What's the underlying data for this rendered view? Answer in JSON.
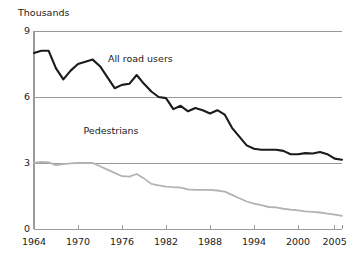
{
  "chart_data": {
    "type": "line",
    "title": "",
    "subtitle": "",
    "unit_label": "Thousands",
    "xlabel": "",
    "ylabel": "",
    "xlim": [
      1964,
      2006
    ],
    "ylim": [
      0,
      9
    ],
    "yticks": [
      0,
      3,
      6,
      9
    ],
    "ytick_labels": [
      "0",
      "3",
      "6",
      "9"
    ],
    "xticks": [
      1964,
      1970,
      1976,
      1982,
      1988,
      1994,
      2000,
      2005
    ],
    "xtick_labels": [
      "1964",
      "1970",
      "1976",
      "1982",
      "1988",
      "1994",
      "2000",
      "2005"
    ],
    "grid": "horizontal",
    "legend_position": "inline-annotations",
    "x": [
      1964,
      1965,
      1966,
      1967,
      1968,
      1969,
      1970,
      1971,
      1972,
      1973,
      1974,
      1975,
      1976,
      1977,
      1978,
      1979,
      1980,
      1981,
      1982,
      1983,
      1984,
      1985,
      1986,
      1987,
      1988,
      1989,
      1990,
      1991,
      1992,
      1993,
      1994,
      1995,
      1996,
      1997,
      1998,
      1999,
      2000,
      2001,
      2002,
      2003,
      2004,
      2005,
      2006
    ],
    "series": [
      {
        "name": "All road users",
        "color": "#1a1a1a",
        "label_x": 1978.5,
        "label_y": 7.75,
        "values": [
          8.0,
          8.1,
          8.1,
          7.3,
          6.8,
          7.2,
          7.5,
          7.6,
          7.7,
          7.4,
          6.9,
          6.4,
          6.55,
          6.6,
          7.0,
          6.6,
          6.25,
          6.0,
          5.95,
          5.45,
          5.6,
          5.35,
          5.5,
          5.4,
          5.25,
          5.4,
          5.2,
          4.6,
          4.2,
          3.8,
          3.65,
          3.6,
          3.6,
          3.6,
          3.55,
          3.4,
          3.4,
          3.45,
          3.43,
          3.5,
          3.4,
          3.2,
          3.15
        ]
      },
      {
        "name": "Pedestrians",
        "color": "#b3b3b3",
        "label_x": 1974.5,
        "label_y": 4.45,
        "values": [
          3.0,
          3.05,
          3.03,
          2.9,
          2.95,
          2.98,
          3.0,
          3.0,
          3.0,
          2.85,
          2.7,
          2.55,
          2.4,
          2.38,
          2.5,
          2.3,
          2.05,
          1.98,
          1.93,
          1.9,
          1.88,
          1.8,
          1.78,
          1.78,
          1.78,
          1.75,
          1.7,
          1.55,
          1.4,
          1.25,
          1.15,
          1.08,
          1.0,
          0.98,
          0.92,
          0.88,
          0.85,
          0.8,
          0.78,
          0.75,
          0.7,
          0.65,
          0.6
        ]
      }
    ]
  }
}
